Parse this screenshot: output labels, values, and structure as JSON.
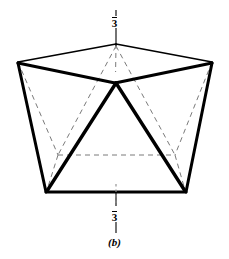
{
  "figure": {
    "caption": "(b)",
    "axis_label_top": "3",
    "axis_label_bottom": "3",
    "axis_label_has_overbar": true,
    "axis_symbol_meaning": "three-bar-improper-rotation-axis",
    "line_color": "#000000",
    "dashed_color": "#7a7a7a",
    "background_color": "#ffffff",
    "solid_stroke_width_heavy": 3.0,
    "solid_stroke_width_light": 1.6,
    "dashed_stroke_width": 1.0,
    "dash_pattern": "5,4",
    "geometry": {
      "type": "trigonal-antiprism-polyhedron",
      "apex_top": [
        116,
        44
      ],
      "vertex_upper_left": [
        18,
        62
      ],
      "vertex_upper_right": [
        212,
        62
      ],
      "center_point": [
        115,
        83
      ],
      "vertex_lower_left": [
        46,
        192
      ],
      "vertex_lower_right": [
        186,
        192
      ],
      "hidden_left": [
        58,
        155
      ],
      "hidden_right": [
        175,
        155
      ],
      "axis_line_top": [
        [
          116,
          10
        ],
        [
          116,
          72
        ]
      ],
      "axis_line_bottom": [
        [
          116,
          184
        ],
        [
          116,
          232
        ]
      ]
    }
  }
}
